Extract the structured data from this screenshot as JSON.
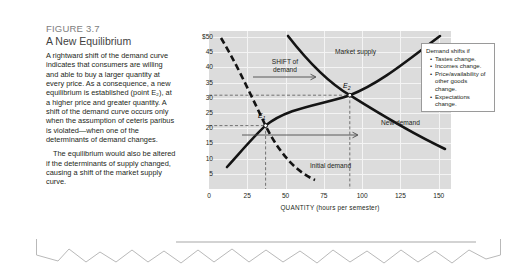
{
  "figure": {
    "number": "FIGURE 3.7",
    "title": "A New Equilibrium",
    "paragraph_1": "A rightward shift of the demand curve indicates that consumers are willing and able to buy a larger quantity at every price. As a consequence, a new equilibrium is established (point E₂), at a higher price and greater quantity. A shift of the demand curve occurs only when the assumption of ceteris paribus is violated—when one of the determinants of demand changes.",
    "paragraph_2": "The equilibrium would also be altered if the determinants of supply changed, causing a shift of the market supply curve."
  },
  "legend": {
    "title": "Demand shifts if",
    "items": [
      "Tastes change.",
      "Incomes change.",
      "Price/availability of other goods change.",
      "Expectations change."
    ]
  },
  "annotations": {
    "shift_line1": "SHIFT of",
    "shift_line2": "demand",
    "market_supply": "Market supply",
    "new_demand": "New demand",
    "initial_demand": "Initial demand",
    "e1": "E",
    "e1_sub": "1",
    "e2": "E",
    "e2_sub": "2"
  },
  "chart_data": {
    "type": "line",
    "title": "A New Equilibrium",
    "xlabel": "QUANTITY (hours per semester)",
    "ylabel": "PRICE OF TUTORING (per hour)",
    "xlim": [
      0,
      158
    ],
    "ylim": [
      0,
      52
    ],
    "xticks": [
      0,
      25,
      50,
      75,
      100,
      125,
      150
    ],
    "xticklabels": [
      "0",
      "25",
      "50",
      "75",
      "100",
      "125",
      "150"
    ],
    "yticks": [
      5,
      10,
      15,
      20,
      25,
      30,
      35,
      40,
      45,
      50
    ],
    "yticklabels": [
      "5",
      "10",
      "15",
      "20",
      "25",
      "30",
      "35",
      "40",
      "45",
      "$50"
    ],
    "grid": true,
    "legend_position": "inline-labels",
    "series": [
      {
        "name": "Initial demand",
        "style": "dashed",
        "color": "#1a1a1a",
        "x": [
          8,
          15,
          22,
          30,
          37,
          45,
          55,
          65,
          73,
          80
        ],
        "y": [
          50,
          42,
          34,
          26,
          20,
          16,
          13,
          10,
          8,
          6
        ]
      },
      {
        "name": "Market supply",
        "style": "solid",
        "color": "#1a1a1a",
        "x": [
          12,
          22,
          32,
          37,
          50,
          65,
          80,
          92,
          110,
          130,
          150
        ],
        "y": [
          10,
          13.5,
          17.5,
          20,
          23,
          25.5,
          27.5,
          30,
          35,
          42,
          50
        ]
      },
      {
        "name": "New demand",
        "style": "solid",
        "color": "#1a1a1a",
        "x": [
          52,
          62,
          72,
          82,
          92,
          105,
          118,
          132,
          150
        ],
        "y": [
          50,
          43,
          37,
          33,
          30,
          25,
          21,
          17,
          13
        ]
      }
    ],
    "points": [
      {
        "label": "E1",
        "x": 37,
        "y": 20
      },
      {
        "label": "E2",
        "x": 92,
        "y": 30
      }
    ],
    "annotations": [
      {
        "text": "SHIFT of demand",
        "x": 55,
        "y": 38,
        "type": "arrow-right"
      },
      {
        "text": "",
        "x": 60,
        "y": 17,
        "type": "arrow-right"
      }
    ]
  }
}
